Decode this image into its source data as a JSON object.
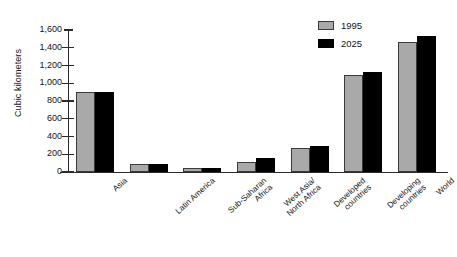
{
  "chart_data": {
    "type": "bar",
    "title": "",
    "xlabel": "",
    "ylabel": "Cubic kilometers",
    "ylim": [
      0,
      1600
    ],
    "ytick_labels": [
      "1,600",
      "1,400",
      "1,200",
      "1,000",
      "800",
      "600",
      "400",
      "200",
      "0"
    ],
    "ytick_values": [
      1600,
      1400,
      1200,
      1000,
      800,
      600,
      400,
      200,
      0
    ],
    "grid": false,
    "legend_position": "top-right",
    "categories": [
      "Asia",
      "Latin America",
      "Sub-Saharan Africa",
      "West Asia/ North Africa",
      "Developed countries",
      "Developing countries",
      "World"
    ],
    "category_lines": [
      [
        "Asia"
      ],
      [
        "Latin America"
      ],
      [
        "Sub-Saharan",
        "Africa"
      ],
      [
        "West Asia/",
        "North Africa"
      ],
      [
        "Developed",
        "countries"
      ],
      [
        "Developing",
        "countries"
      ],
      [
        "World"
      ]
    ],
    "series": [
      {
        "name": "1995",
        "color": "#a9a9a9",
        "values": [
          905,
          90,
          45,
          115,
          270,
          1090,
          1470
        ]
      },
      {
        "name": "2025",
        "color": "#000000",
        "values": [
          900,
          92,
          42,
          155,
          290,
          1130,
          1530
        ]
      }
    ]
  },
  "legend": {
    "items": [
      {
        "label": "1995",
        "swatch": "legend-swatch-1995"
      },
      {
        "label": "2025",
        "swatch": "legend-swatch-2025"
      }
    ]
  }
}
